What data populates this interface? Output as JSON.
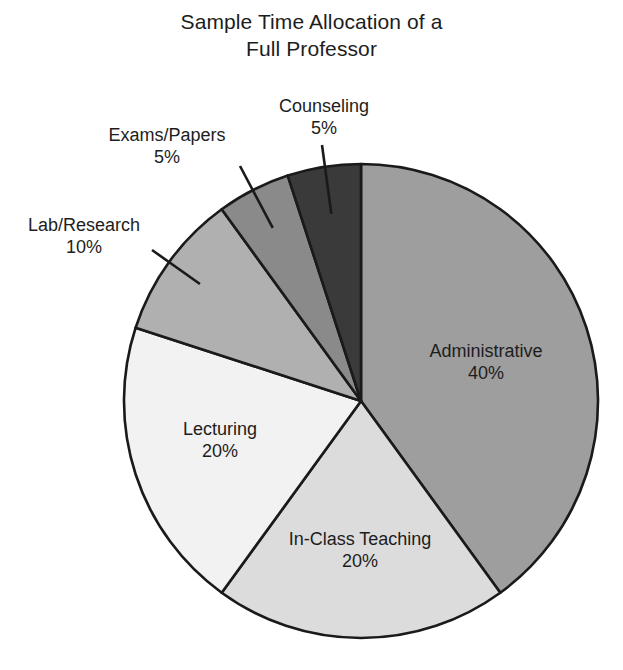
{
  "title": {
    "line1": "Sample Time Allocation of a",
    "line2": "Full Professor"
  },
  "chart_data": {
    "type": "pie",
    "title": "Sample Time Allocation of a Full Professor",
    "xlabel": "",
    "ylabel": "",
    "units": "percent",
    "total": 100,
    "start_angle_deg": 0,
    "direction": "clockwise",
    "legend": "none (labels placed on/around slices)",
    "grid": false,
    "categories": [
      "Administrative",
      "In-Class Teaching",
      "Lecturing",
      "Lab/Research",
      "Exams/Papers",
      "Counseling"
    ],
    "values": [
      40,
      20,
      20,
      10,
      5,
      5
    ],
    "slices": [
      {
        "label": "Administrative",
        "value": 40,
        "value_text": "40%",
        "color": "#9e9e9e",
        "label_placement": "inside"
      },
      {
        "label": "In-Class Teaching",
        "value": 20,
        "value_text": "20%",
        "color": "#dcdcdc",
        "label_placement": "inside"
      },
      {
        "label": "Lecturing",
        "value": 20,
        "value_text": "20%",
        "color": "#f2f2f2",
        "label_placement": "inside"
      },
      {
        "label": "Lab/Research",
        "value": 10,
        "value_text": "10%",
        "color": "#b0b0b0",
        "label_placement": "outside-callout"
      },
      {
        "label": "Exams/Papers",
        "value": 5,
        "value_text": "5%",
        "color": "#8a8a8a",
        "label_placement": "outside-callout"
      },
      {
        "label": "Counseling",
        "value": 5,
        "value_text": "5%",
        "color": "#3a3a3a",
        "label_placement": "outside-callout"
      }
    ],
    "stroke_color": "#1a1a1a",
    "background_color": "#ffffff"
  },
  "labels": {
    "counseling": {
      "name": "Counseling",
      "value": "5%"
    },
    "exams": {
      "name": "Exams/Papers",
      "value": "5%"
    },
    "lab": {
      "name": "Lab/Research",
      "value": "10%"
    },
    "administrative": {
      "name": "Administrative",
      "value": "40%"
    },
    "lecturing": {
      "name": "Lecturing",
      "value": "20%"
    },
    "inclass": {
      "name": "In-Class Teaching",
      "value": "20%"
    }
  }
}
